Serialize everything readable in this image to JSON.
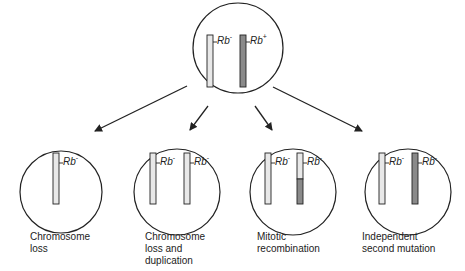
{
  "diagram": {
    "colors": {
      "outline": "#222222",
      "chromosome_light": "#e8e8e8",
      "chromosome_dark": "#8a8a8a",
      "background": "#ffffff"
    },
    "parent": {
      "genes": [
        {
          "name": "Rb",
          "allele": "-",
          "shade": "light"
        },
        {
          "name": "Rb",
          "allele": "+",
          "shade": "dark"
        }
      ]
    },
    "outcomes": [
      {
        "label_lines": [
          "Chromosome",
          "loss"
        ],
        "genes": [
          {
            "name": "Rb",
            "allele": "-",
            "shade": "light"
          }
        ]
      },
      {
        "label_lines": [
          "Chromosome",
          "loss and",
          "duplication"
        ],
        "genes": [
          {
            "name": "Rb",
            "allele": "-",
            "shade": "light"
          },
          {
            "name": "Rb",
            "allele": "-",
            "shade": "light"
          }
        ]
      },
      {
        "label_lines": [
          "Mitotic",
          "recombination"
        ],
        "genes": [
          {
            "name": "Rb",
            "allele": "-",
            "shade": "light"
          },
          {
            "name": "Rb",
            "allele": "-",
            "shade": "light-top-dark-bottom"
          }
        ]
      },
      {
        "label_lines": [
          "Independent",
          "second mutation"
        ],
        "genes": [
          {
            "name": "Rb",
            "allele": "-",
            "shade": "light"
          },
          {
            "name": "Rb",
            "allele": "-",
            "shade": "dark"
          }
        ]
      }
    ]
  }
}
